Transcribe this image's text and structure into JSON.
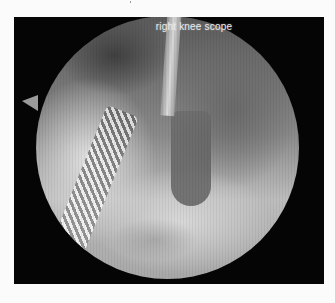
{
  "image": {
    "description": "Arthroscopic view inside a right knee joint showing a shaver instrument and probe",
    "overlay_label": "right knee scope",
    "colors": {
      "page_background": "#fbfbfb",
      "frame_background": "#050505",
      "label_color": "#e8e8e8"
    }
  }
}
